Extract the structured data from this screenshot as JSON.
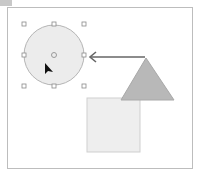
{
  "canvas": {
    "frame": {
      "x": 7,
      "y": 7,
      "width": 186,
      "height": 162,
      "border": "#bdbdbd"
    },
    "shapes": [
      {
        "type": "rectangle",
        "name": "square",
        "x": 87,
        "y": 98,
        "width": 53,
        "height": 54,
        "fill": "#eeeeee",
        "stroke": "#cfcfcf"
      },
      {
        "type": "triangle",
        "name": "triangle",
        "points": "146,58 174,100 121,100",
        "fill": "#b8b8b8",
        "stroke": "#a8a8a8"
      },
      {
        "type": "circle",
        "name": "circle",
        "cx": 54,
        "cy": 55,
        "r": 30,
        "fill": "#ececec",
        "stroke": "#b5b5b5",
        "selected": true
      },
      {
        "type": "arrow",
        "name": "connector-arrow",
        "x1": 145,
        "y1": 57,
        "x2": 90,
        "y2": 57,
        "stroke": "#666666"
      }
    ],
    "selection_handles": [
      {
        "x": 24,
        "y": 24
      },
      {
        "x": 54,
        "y": 24
      },
      {
        "x": 84,
        "y": 24
      },
      {
        "x": 24,
        "y": 55
      },
      {
        "x": 84,
        "y": 55
      },
      {
        "x": 24,
        "y": 86
      },
      {
        "x": 54,
        "y": 86
      },
      {
        "x": 84,
        "y": 86
      }
    ],
    "center_marker": {
      "x": 54,
      "y": 55
    },
    "cursor": {
      "x": 45,
      "y": 63,
      "icon": "arrow-pointer-icon"
    }
  }
}
